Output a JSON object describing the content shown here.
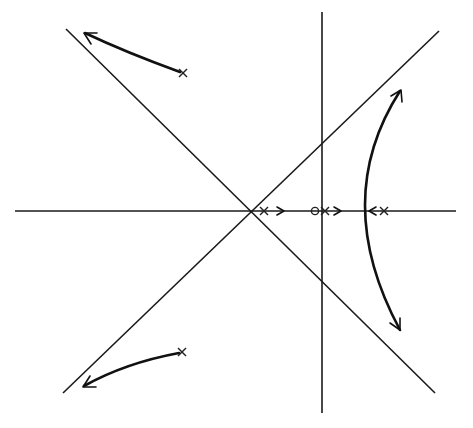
{
  "diagram": {
    "type": "root-locus",
    "colors": {
      "ink": "#1a1a1a",
      "background": "#ffffff"
    },
    "axes": {
      "real_axis": {
        "x1": 15,
        "y1": 211,
        "x2": 456,
        "y2": 211
      },
      "imag_axis": {
        "x1": 322,
        "y1": 12,
        "x2": 322,
        "y2": 413
      }
    },
    "asymptotes": [
      {
        "name": "asymptote-rising",
        "x1": 63,
        "y1": 393,
        "x2": 439,
        "y2": 31
      },
      {
        "name": "asymptote-falling",
        "x1": 66,
        "y1": 29,
        "x2": 435,
        "y2": 393
      }
    ],
    "centroid": {
      "x": 250,
      "y": 211
    },
    "poles": [
      {
        "name": "pole-upper-left",
        "x": 183,
        "y": 73
      },
      {
        "name": "pole-lower-left",
        "x": 182,
        "y": 352
      },
      {
        "name": "pole-real-1",
        "x": 264,
        "y": 211
      },
      {
        "name": "pole-real-2",
        "x": 325,
        "y": 211
      },
      {
        "name": "pole-real-3",
        "x": 384,
        "y": 211
      }
    ],
    "zeros": [
      {
        "name": "zero-real",
        "x": 315,
        "y": 211,
        "r": 4
      }
    ]
  }
}
